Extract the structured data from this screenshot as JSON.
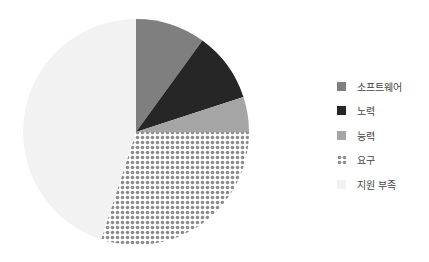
{
  "chart_data": {
    "type": "pie",
    "title": "",
    "categories": [
      "소프트웨어",
      "노력",
      "능력",
      "요구",
      "지원 부족"
    ],
    "values": [
      10,
      10,
      5,
      30,
      45
    ],
    "colors": [
      "#7f7f7f",
      "#262626",
      "#a5a5a5",
      "pattern-dots",
      "#f2f2f2"
    ],
    "start_angle": "top (12 o'clock), clockwise",
    "legend_position": "right"
  },
  "legend": {
    "items": [
      {
        "label": "소프트웨어",
        "color": "#7f7f7f"
      },
      {
        "label": "노력",
        "color": "#262626"
      },
      {
        "label": "능력",
        "color": "#a5a5a5"
      },
      {
        "label": "요구",
        "color": "pattern-dots"
      },
      {
        "label": "지원 부족",
        "color": "#f2f2f2"
      }
    ]
  }
}
